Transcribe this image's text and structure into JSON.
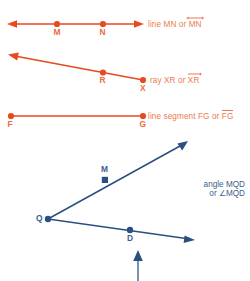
{
  "page": {
    "width": 250,
    "height": 281,
    "background": "#ffffff"
  },
  "colors": {
    "figure_red": "#E8491E",
    "caption_red": "#EC7A4E",
    "point_label_red": "#E96A3C",
    "figure_blue": "#2B4F81",
    "caption_blue": "#3C5E8C"
  },
  "figures": [
    {
      "id": "line-mn",
      "kind": "line",
      "color": "#E8491E",
      "caption_prefix": "line MN or ",
      "caption_symbol": "MN",
      "caption_symbol_decoration": "double-arrow-overbar",
      "points": [
        {
          "label": "M",
          "x": 57,
          "y": 24
        },
        {
          "label": "N",
          "x": 103,
          "y": 24
        }
      ],
      "endpoints": {
        "x1": 8,
        "y1": 24,
        "x2": 143,
        "y2": 24
      },
      "arrows": "both"
    },
    {
      "id": "ray-xr",
      "kind": "ray",
      "color": "#E8491E",
      "caption_prefix": "ray XR or ",
      "caption_symbol": "XR",
      "caption_symbol_decoration": "ray-arrow-overbar",
      "points": [
        {
          "label": "R",
          "x": 103,
          "y": 73
        },
        {
          "label": "X",
          "x": 143,
          "y": 80
        }
      ],
      "endpoints": {
        "x1": 143,
        "y1": 80,
        "x2": 10,
        "y2": 55
      },
      "arrows": "start"
    },
    {
      "id": "segment-fg",
      "kind": "segment",
      "color": "#E8491E",
      "caption_prefix": "line segment FG or ",
      "caption_symbol": "FG",
      "caption_symbol_decoration": "plain-overbar",
      "points": [
        {
          "label": "F",
          "x": 11,
          "y": 116
        },
        {
          "label": "G",
          "x": 143,
          "y": 116
        }
      ],
      "endpoints": {
        "x1": 11,
        "y1": 116,
        "x2": 143,
        "y2": 116
      },
      "arrows": "none"
    },
    {
      "id": "angle-mqd",
      "kind": "angle",
      "color": "#2B4F81",
      "caption_line1": "angle MQD",
      "caption_line2": "or ∠MQD",
      "vertex": {
        "label": "Q",
        "x": 48,
        "y": 219
      },
      "points": [
        {
          "label": "M",
          "x": 105,
          "y": 180
        },
        {
          "label": "D",
          "x": 130,
          "y": 230
        }
      ],
      "rays": [
        {
          "from": [
            48,
            219
          ],
          "to": [
            186,
            142
          ],
          "arrow": "end"
        },
        {
          "from": [
            48,
            219
          ],
          "to": [
            194,
            240
          ],
          "arrow": "end"
        }
      ]
    }
  ],
  "pointer": {
    "id": "up-arrow-pointer",
    "color": "#4E6F93",
    "x": 138,
    "y_tail": 281,
    "y_head": 251
  }
}
